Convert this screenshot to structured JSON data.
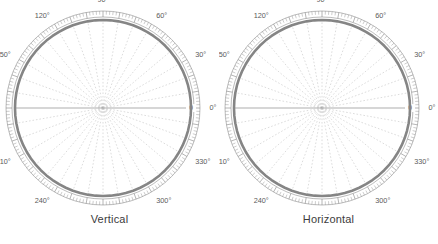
{
  "figure": {
    "type": "polar-radiation-pattern-figure",
    "panel_count": 2
  },
  "panels": [
    {
      "caption": "Vertical",
      "angle_labels": [
        "0°",
        "30°",
        "60°",
        "90°",
        "120°",
        "150°",
        "180°",
        "210°",
        "240°",
        "270°",
        "300°",
        "330°"
      ],
      "radial_labels": [
        "20",
        "10",
        "0"
      ]
    },
    {
      "caption": "Horizontal",
      "angle_labels": [
        "0°",
        "30°",
        "60°",
        "90°",
        "120°",
        "150°",
        "180°",
        "210°",
        "240°",
        "270°",
        "300°",
        "330°"
      ],
      "radial_labels": [
        "20",
        "10",
        "0"
      ]
    }
  ],
  "colors": {
    "trace": "#858585",
    "grid": "#b9b9b9",
    "rim": "#8d8d8d",
    "text": "#4a4a4a",
    "background": "#ffffff"
  },
  "chart_data": [
    {
      "type": "line",
      "title": "Vertical",
      "xlabel": "Angle (degrees)",
      "ylabel": "Relative gain (dB)",
      "coordinate_system": "polar",
      "grid": true,
      "legend": null,
      "angle_tick_labels": [
        "0°",
        "30°",
        "60°",
        "90°",
        "120°",
        "150°",
        "180°",
        "210°",
        "240°",
        "270°",
        "300°",
        "330°"
      ],
      "angle_tick_values": [
        0,
        30,
        60,
        90,
        120,
        150,
        180,
        210,
        240,
        270,
        300,
        330
      ],
      "angle_minor_tick_step_deg": 2,
      "radial_tick_labels": [
        "20",
        "10",
        "0"
      ],
      "radial_tick_values": [
        20,
        10,
        0
      ],
      "radial_axis_direction": "attenuation-increasing-inward",
      "rlim": [
        30,
        0
      ],
      "series": [
        {
          "name": "Vertical pattern",
          "angles_deg": [
            0,
            5,
            10,
            15,
            20,
            25,
            30,
            35,
            40,
            45,
            50,
            55,
            60,
            65,
            70,
            75,
            80,
            85,
            90,
            95,
            100,
            105,
            110,
            115,
            120,
            125,
            130,
            135,
            140,
            145,
            150,
            155,
            160,
            165,
            170,
            175,
            180,
            185,
            190,
            195,
            200,
            205,
            210,
            215,
            220,
            225,
            230,
            235,
            240,
            245,
            250,
            255,
            260,
            265,
            270,
            275,
            280,
            285,
            290,
            295,
            300,
            305,
            310,
            315,
            320,
            325,
            330,
            335,
            340,
            345,
            350,
            355,
            360
          ],
          "gain_db": [
            -0.4,
            -0.3,
            -0.3,
            -0.4,
            -0.7,
            -1.2,
            -1.9,
            -2.8,
            -4.0,
            -5.6,
            -7.4,
            -9.6,
            -12.2,
            -15.5,
            -19.5,
            -24.0,
            -27.5,
            -24.5,
            -19.0,
            -14.5,
            -11.8,
            -10.6,
            -10.4,
            -11.0,
            -12.6,
            -15.6,
            -20.0,
            -25.0,
            -27.0,
            -23.5,
            -20.0,
            -19.0,
            -20.0,
            -23.0,
            -26.5,
            -28.0,
            -27.0,
            -25.5,
            -24.5,
            -24.5,
            -25.5,
            -27.0,
            -28.0,
            -26.0,
            -23.0,
            -21.0,
            -20.5,
            -21.5,
            -24.0,
            -27.0,
            -27.5,
            -24.0,
            -20.0,
            -17.0,
            -15.5,
            -15.0,
            -15.8,
            -17.5,
            -20.5,
            -24.5,
            -26.5,
            -22.0,
            -16.5,
            -12.0,
            -8.4,
            -5.6,
            -3.6,
            -2.2,
            -1.3,
            -0.7,
            -0.4,
            -0.3,
            -0.4
          ]
        }
      ],
      "main_lobe_direction_deg": 350,
      "main_lobe_peak_db": 0
    },
    {
      "type": "line",
      "title": "Horizontal",
      "xlabel": "Angle (degrees)",
      "ylabel": "Relative gain (dB)",
      "coordinate_system": "polar",
      "grid": true,
      "legend": null,
      "angle_tick_labels": [
        "0°",
        "30°",
        "60°",
        "90°",
        "120°",
        "150°",
        "180°",
        "210°",
        "240°",
        "270°",
        "300°",
        "330°"
      ],
      "angle_tick_values": [
        0,
        30,
        60,
        90,
        120,
        150,
        180,
        210,
        240,
        270,
        300,
        330
      ],
      "angle_minor_tick_step_deg": 2,
      "radial_tick_labels": [
        "20",
        "10",
        "0"
      ],
      "radial_tick_values": [
        20,
        10,
        0
      ],
      "radial_axis_direction": "attenuation-increasing-inward",
      "rlim": [
        30,
        0
      ],
      "series": [
        {
          "name": "Horizontal pattern",
          "angles_deg": [
            0,
            5,
            10,
            15,
            20,
            25,
            30,
            35,
            40,
            45,
            50,
            55,
            60,
            65,
            70,
            75,
            80,
            85,
            90,
            95,
            100,
            105,
            110,
            115,
            120,
            125,
            130,
            135,
            140,
            145,
            150,
            155,
            160,
            165,
            170,
            175,
            180,
            185,
            190,
            195,
            200,
            205,
            210,
            215,
            220,
            225,
            230,
            235,
            240,
            245,
            250,
            255,
            260,
            265,
            270,
            275,
            280,
            285,
            290,
            295,
            300,
            305,
            310,
            315,
            320,
            325,
            330,
            335,
            340,
            345,
            350,
            355,
            360
          ],
          "gain_db": [
            -0.2,
            -0.2,
            -0.2,
            -0.3,
            -0.5,
            -0.9,
            -1.5,
            -2.3,
            -3.4,
            -4.8,
            -6.5,
            -8.6,
            -11.2,
            -14.4,
            -18.2,
            -22.5,
            -25.5,
            -22.0,
            -17.0,
            -13.0,
            -10.6,
            -9.6,
            -9.4,
            -10.0,
            -11.4,
            -14.0,
            -18.0,
            -23.0,
            -27.0,
            -27.5,
            -26.5,
            -26.0,
            -26.5,
            -27.5,
            -28.5,
            -29.0,
            -29.0,
            -28.5,
            -28.0,
            -27.5,
            -27.5,
            -28.0,
            -28.5,
            -27.5,
            -25.0,
            -22.0,
            -19.5,
            -18.0,
            -17.5,
            -18.2,
            -20.0,
            -23.0,
            -26.5,
            -28.0,
            -25.0,
            -21.0,
            -17.5,
            -15.0,
            -13.6,
            -13.4,
            -14.2,
            -15.8,
            -14.0,
            -10.5,
            -7.4,
            -4.8,
            -3.0,
            -1.8,
            -1.0,
            -0.5,
            -0.3,
            -0.2,
            -0.2
          ]
        }
      ],
      "main_lobe_direction_deg": 350,
      "main_lobe_peak_db": 0
    }
  ]
}
